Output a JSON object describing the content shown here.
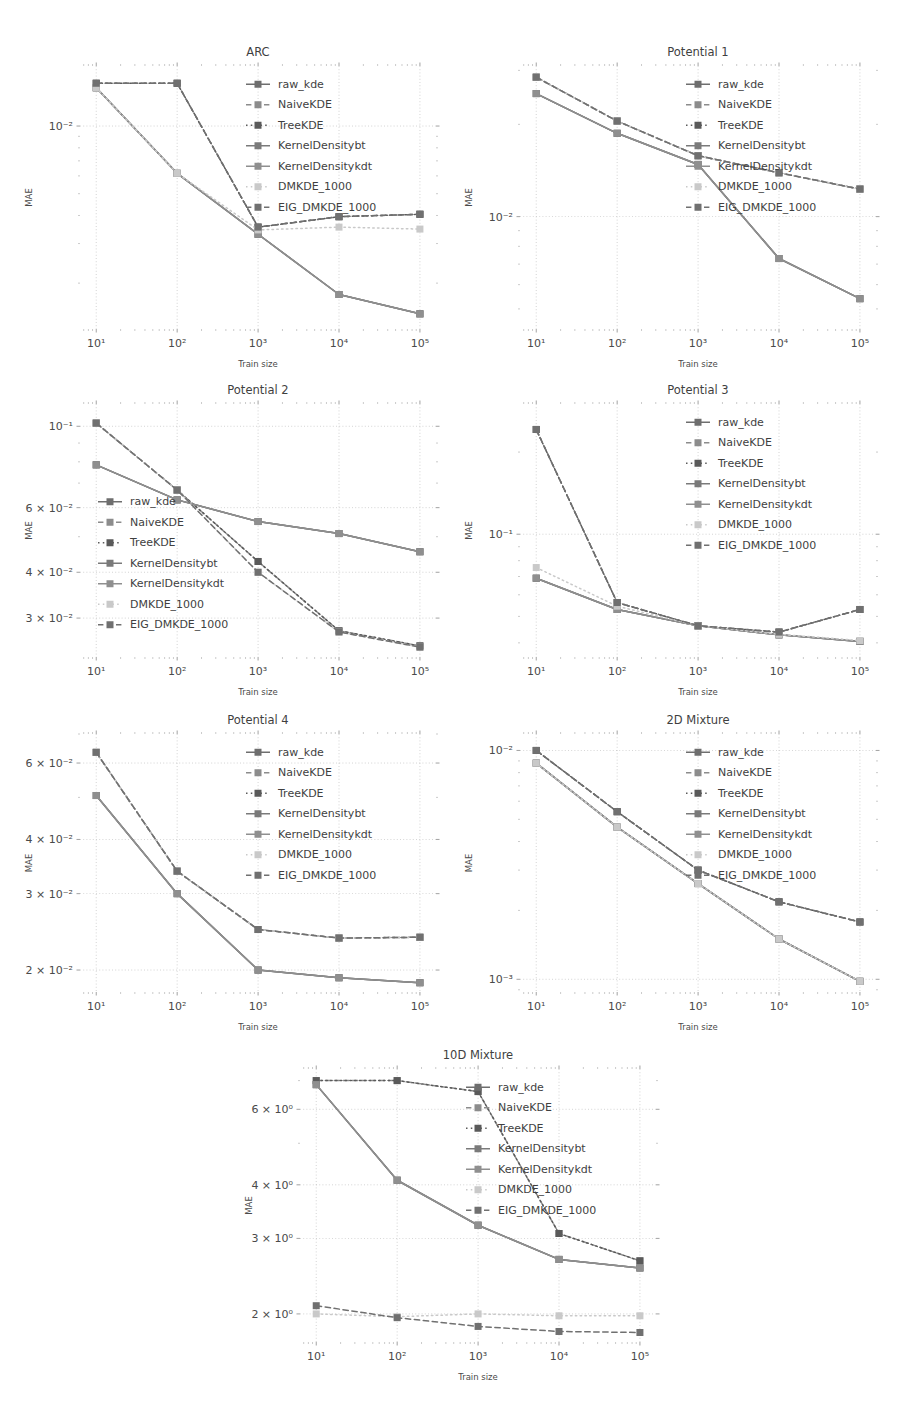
{
  "figure": {
    "width": 903,
    "height": 1401,
    "background": "#ffffff",
    "layout": "7 log-log line panels: 3 rows of 2 plus 1 centered bottom panel"
  },
  "series_style": {
    "names": [
      "raw_kde",
      "NaiveKDE",
      "TreeKDE",
      "KernelDensitybt",
      "KernelDensitykdt",
      "DMKDE_1000",
      "EIG_DMKDE_1000"
    ],
    "colors": [
      "#6e6e6e",
      "#8c8c8c",
      "#5a5a5a",
      "#7a7a7a",
      "#8f8f8f",
      "#c9c9c9",
      "#707070"
    ],
    "dashes": [
      "solid",
      "dashed",
      "dotted",
      "solid",
      "solid",
      "dotted",
      "dashed"
    ]
  },
  "chart_data": [
    {
      "type": "line",
      "title": "ARC",
      "xlabel": "Train size",
      "ylabel": "MAE",
      "xscale": "log",
      "yscale": "log",
      "x": [
        10,
        100,
        1000,
        10000,
        100000
      ],
      "xticklabels": [
        "10¹",
        "10²",
        "10³",
        "10⁴",
        "10⁵"
      ],
      "xlim": [
        6.3,
        158000
      ],
      "ylim": [
        0.00125,
        0.0185
      ],
      "yticks": [
        0.01
      ],
      "yticklabels": [
        "10⁻²"
      ],
      "grid": true,
      "legend": "upper right",
      "series": [
        {
          "name": "raw_kde",
          "values": [
            0.0148,
            0.00616,
            0.0033,
            0.00178,
            0.00146
          ]
        },
        {
          "name": "NaiveKDE",
          "values": [
            0.0155,
            0.0155,
            0.00355,
            0.00395,
            0.00405
          ]
        },
        {
          "name": "TreeKDE",
          "values": [
            0.0155,
            0.0155,
            0.00355,
            0.00395,
            0.00405
          ]
        },
        {
          "name": "KernelDensitybt",
          "values": [
            0.0148,
            0.00616,
            0.0033,
            0.00178,
            0.00146
          ]
        },
        {
          "name": "KernelDensitykdt",
          "values": [
            0.0148,
            0.00616,
            0.0033,
            0.00178,
            0.00146
          ]
        },
        {
          "name": "DMKDE_1000",
          "values": [
            0.0148,
            0.00616,
            0.00345,
            0.00355,
            0.00348
          ]
        },
        {
          "name": "EIG_DMKDE_1000",
          "values": [
            0.0155,
            0.0155,
            0.00355,
            0.00395,
            0.00405
          ]
        }
      ]
    },
    {
      "type": "line",
      "title": "Potential 1",
      "xlabel": "Train size",
      "ylabel": "MAE",
      "xscale": "log",
      "yscale": "log",
      "x": [
        10,
        100,
        1000,
        10000,
        100000
      ],
      "xticklabels": [
        "10¹",
        "10²",
        "10³",
        "10⁴",
        "10⁵"
      ],
      "xlim": [
        6.3,
        158000
      ],
      "ylim": [
        0.0043,
        0.031
      ],
      "yticks": [
        0.01
      ],
      "yticklabels": [
        "10⁻²"
      ],
      "grid": true,
      "legend": "upper right",
      "series": [
        {
          "name": "raw_kde",
          "values": [
            0.0252,
            0.0187,
            0.0148,
            0.0073,
            0.0054
          ]
        },
        {
          "name": "NaiveKDE",
          "values": [
            0.0285,
            0.0205,
            0.0158,
            0.0139,
            0.0123
          ]
        },
        {
          "name": "TreeKDE",
          "values": [
            0.0285,
            0.0205,
            0.0158,
            0.0139,
            0.0123
          ]
        },
        {
          "name": "KernelDensitybt",
          "values": [
            0.0252,
            0.0187,
            0.0148,
            0.0073,
            0.0054
          ]
        },
        {
          "name": "KernelDensitykdt",
          "values": [
            0.0252,
            0.0187,
            0.0148,
            0.0073,
            0.0054
          ]
        },
        {
          "name": "DMKDE_1000",
          "values": [
            0.0285,
            0.0205,
            0.0158,
            0.0139,
            0.0123
          ]
        },
        {
          "name": "EIG_DMKDE_1000",
          "values": [
            0.0285,
            0.0205,
            0.0158,
            0.0139,
            0.0123
          ]
        }
      ]
    },
    {
      "type": "line",
      "title": "Potential 2",
      "xlabel": "Train size",
      "ylabel": "MAE",
      "xscale": "log",
      "yscale": "log",
      "x": [
        10,
        100,
        1000,
        10000,
        100000
      ],
      "xticklabels": [
        "10¹",
        "10²",
        "10³",
        "10⁴",
        "10⁵"
      ],
      "xlim": [
        6.3,
        158000
      ],
      "ylim": [
        0.0235,
        0.115
      ],
      "yticks": [
        0.1,
        0.06,
        0.04,
        0.03
      ],
      "yticklabels": [
        "10⁻¹",
        "6 × 10⁻²",
        "4 × 10⁻²",
        "3 × 10⁻²"
      ],
      "grid": true,
      "legend": "lower left",
      "series": [
        {
          "name": "raw_kde",
          "values": [
            0.0785,
            0.063,
            0.055,
            0.051,
            0.0455
          ]
        },
        {
          "name": "NaiveKDE",
          "values": [
            0.102,
            0.067,
            0.0428,
            0.0277,
            0.0252
          ]
        },
        {
          "name": "TreeKDE",
          "values": [
            0.102,
            0.067,
            0.0428,
            0.0277,
            0.0252
          ]
        },
        {
          "name": "KernelDensitybt",
          "values": [
            0.0785,
            0.063,
            0.055,
            0.051,
            0.0455
          ]
        },
        {
          "name": "KernelDensitykdt",
          "values": [
            0.0785,
            0.063,
            0.055,
            0.051,
            0.0455
          ]
        },
        {
          "name": "DMKDE_1000",
          "values": [
            0.102,
            0.067,
            0.04,
            0.0275,
            0.025
          ]
        },
        {
          "name": "EIG_DMKDE_1000",
          "values": [
            0.102,
            0.067,
            0.04,
            0.0275,
            0.025
          ]
        }
      ]
    },
    {
      "type": "line",
      "title": "Potential 3",
      "xlabel": "Train size",
      "ylabel": "MAE",
      "xscale": "log",
      "yscale": "log",
      "x": [
        10,
        100,
        1000,
        10000,
        100000
      ],
      "xticklabels": [
        "10¹",
        "10²",
        "10³",
        "10⁴",
        "10⁵"
      ],
      "xlim": [
        6.3,
        158000
      ],
      "ylim": [
        0.0355,
        0.3
      ],
      "yticks": [
        0.1
      ],
      "yticklabels": [
        "10⁻¹"
      ],
      "grid": true,
      "legend": "upper right",
      "series": [
        {
          "name": "raw_kde",
          "values": [
            0.069,
            0.053,
            0.0462,
            0.0428,
            0.0405
          ]
        },
        {
          "name": "NaiveKDE",
          "values": [
            0.242,
            0.0562,
            0.0462,
            0.0438,
            0.053
          ]
        },
        {
          "name": "TreeKDE",
          "values": [
            0.242,
            0.0562,
            0.0462,
            0.0438,
            0.053
          ]
        },
        {
          "name": "KernelDensitybt",
          "values": [
            0.069,
            0.053,
            0.0462,
            0.0428,
            0.0405
          ]
        },
        {
          "name": "KernelDensitykdt",
          "values": [
            0.069,
            0.053,
            0.0462,
            0.0428,
            0.0405
          ]
        },
        {
          "name": "DMKDE_1000",
          "values": [
            0.0755,
            0.0545,
            0.0462,
            0.043,
            0.0408
          ]
        },
        {
          "name": "EIG_DMKDE_1000",
          "values": [
            0.242,
            0.0562,
            0.0462,
            0.0438,
            0.053
          ]
        }
      ]
    },
    {
      "type": "line",
      "title": "Potential 4",
      "xlabel": "Train size",
      "ylabel": "MAE",
      "xscale": "log",
      "yscale": "log",
      "x": [
        10,
        100,
        1000,
        10000,
        100000
      ],
      "xticklabels": [
        "10¹",
        "10²",
        "10³",
        "10⁴",
        "10⁵"
      ],
      "xlim": [
        6.3,
        158000
      ],
      "ylim": [
        0.0178,
        0.07
      ],
      "yticks": [
        0.06,
        0.04,
        0.03,
        0.02
      ],
      "yticklabels": [
        "6 × 10⁻²",
        "4 × 10⁻²",
        "3 × 10⁻²",
        "2 × 10⁻²"
      ],
      "grid": true,
      "legend": "upper right",
      "series": [
        {
          "name": "raw_kde",
          "values": [
            0.0505,
            0.03,
            0.02,
            0.0192,
            0.0187
          ]
        },
        {
          "name": "NaiveKDE",
          "values": [
            0.0635,
            0.0338,
            0.0248,
            0.0237,
            0.0238
          ]
        },
        {
          "name": "TreeKDE",
          "values": [
            0.0635,
            0.0338,
            0.0248,
            0.0237,
            0.0238
          ]
        },
        {
          "name": "KernelDensitybt",
          "values": [
            0.0505,
            0.03,
            0.02,
            0.0192,
            0.0187
          ]
        },
        {
          "name": "KernelDensitykdt",
          "values": [
            0.0505,
            0.03,
            0.02,
            0.0192,
            0.0187
          ]
        },
        {
          "name": "DMKDE_1000",
          "values": [
            0.0635,
            0.0338,
            0.0248,
            0.0237,
            0.0238
          ]
        },
        {
          "name": "EIG_DMKDE_1000",
          "values": [
            0.0635,
            0.0338,
            0.0248,
            0.0237,
            0.0238
          ]
        }
      ]
    },
    {
      "type": "line",
      "title": "2D Mixture",
      "xlabel": "Train size",
      "ylabel": "MAE",
      "xscale": "log",
      "yscale": "log",
      "x": [
        10,
        100,
        1000,
        10000,
        100000
      ],
      "xticklabels": [
        "10¹",
        "10²",
        "10³",
        "10⁴",
        "10⁵"
      ],
      "xlim": [
        6.3,
        158000
      ],
      "ylim": [
        0.00088,
        0.0118
      ],
      "yticks": [
        0.01,
        0.001
      ],
      "yticklabels": [
        "10⁻²",
        "10⁻³"
      ],
      "grid": true,
      "legend": "upper right",
      "series": [
        {
          "name": "raw_kde",
          "values": [
            0.0088,
            0.00462,
            0.00262,
            0.0015,
            0.00098
          ]
        },
        {
          "name": "NaiveKDE",
          "values": [
            0.01,
            0.0054,
            0.003,
            0.00218,
            0.00178
          ]
        },
        {
          "name": "TreeKDE",
          "values": [
            0.01,
            0.0054,
            0.003,
            0.00218,
            0.00178
          ]
        },
        {
          "name": "KernelDensitybt",
          "values": [
            0.0088,
            0.00462,
            0.00262,
            0.0015,
            0.00098
          ]
        },
        {
          "name": "KernelDensitykdt",
          "values": [
            0.0088,
            0.00462,
            0.00262,
            0.0015,
            0.00098
          ]
        },
        {
          "name": "DMKDE_1000",
          "values": [
            0.0088,
            0.00462,
            0.00262,
            0.0015,
            0.00098
          ]
        },
        {
          "name": "EIG_DMKDE_1000",
          "values": [
            0.01,
            0.0054,
            0.003,
            0.00218,
            0.00178
          ]
        }
      ]
    },
    {
      "type": "line",
      "title": "10D Mixture",
      "xlabel": "Train size",
      "ylabel": "MAE",
      "xscale": "log",
      "yscale": "log",
      "x": [
        10,
        100,
        1000,
        10000,
        100000
      ],
      "xticklabels": [
        "10¹",
        "10²",
        "10³",
        "10⁴",
        "10⁵"
      ],
      "xlim": [
        6.3,
        158000
      ],
      "ylim": [
        1.72,
        7.45
      ],
      "yticks": [
        6,
        4,
        3,
        2
      ],
      "yticklabels": [
        "6 × 10⁰",
        "4 × 10⁰",
        "3 × 10⁰",
        "2 × 10⁰"
      ],
      "grid": true,
      "legend": "upper right",
      "series": [
        {
          "name": "raw_kde",
          "values": [
            6.85,
            4.1,
            3.22,
            2.68,
            2.56
          ]
        },
        {
          "name": "NaiveKDE",
          "values": [
            7.0,
            7.0,
            6.6,
            3.08,
            2.66
          ]
        },
        {
          "name": "TreeKDE",
          "values": [
            7.0,
            7.0,
            6.6,
            3.08,
            2.66
          ]
        },
        {
          "name": "KernelDensitybt",
          "values": [
            6.85,
            4.1,
            3.22,
            2.68,
            2.56
          ]
        },
        {
          "name": "KernelDensitykdt",
          "values": [
            6.85,
            4.1,
            3.22,
            2.68,
            2.56
          ]
        },
        {
          "name": "DMKDE_1000",
          "values": [
            2.0,
            1.97,
            2.0,
            1.98,
            1.98
          ]
        },
        {
          "name": "EIG_DMKDE_1000",
          "values": [
            2.09,
            1.96,
            1.87,
            1.82,
            1.81
          ]
        }
      ]
    }
  ]
}
